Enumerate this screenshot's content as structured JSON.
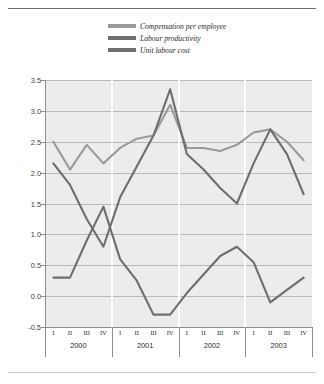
{
  "title": {
    "text": "Chart 3 Changes in unit labour costs, compensation per employee and labour productivity"
  },
  "legend": {
    "position": "top",
    "items": [
      {
        "label": "Compensation per employee",
        "color": "#9a9a9a",
        "key": "compensation_per_employee"
      },
      {
        "label": "Labour productivity",
        "color": "#6e6e6e",
        "key": "labour_productivity"
      },
      {
        "label": "Unit labour cost",
        "color": "#6e6e6e",
        "key": "unit_labour_cost"
      }
    ]
  },
  "axes": {
    "y_ticks": [
      "3.5",
      "3.0",
      "2.5",
      "2.0",
      "1.5",
      "1.0",
      "0.5",
      "0.0",
      "-0.5"
    ],
    "y_min": -0.5,
    "y_max": 3.5,
    "y_step": 0.5,
    "quarters": [
      "I",
      "II",
      "III",
      "IV",
      "I",
      "II",
      "III",
      "IV",
      "I",
      "II",
      "III",
      "IV",
      "I",
      "II",
      "III",
      "IV"
    ],
    "years": [
      "2000",
      "2001",
      "2002",
      "2003"
    ]
  },
  "colors": {
    "plot_background": "#ececec",
    "gridline": "#b9b9b9",
    "axis": "#8e8e8e",
    "series_light": "#9a9a9a",
    "series_dark": "#6e6e6e",
    "text": "#2b2b2b"
  },
  "chart_data": {
    "type": "line",
    "title": "Chart 3 Changes in unit labour costs, compensation per employee and labour productivity",
    "xlabel": "",
    "ylabel": "",
    "ylim": [
      -0.5,
      3.5
    ],
    "grid": true,
    "legend_position": "top",
    "categories": [
      "2000 I",
      "2000 II",
      "2000 III",
      "2000 IV",
      "2001 I",
      "2001 II",
      "2001 III",
      "2001 IV",
      "2002 I",
      "2002 II",
      "2002 III",
      "2002 IV",
      "2003 I",
      "2003 II",
      "2003 III",
      "2003 IV"
    ],
    "series": [
      {
        "name": "Compensation per employee",
        "color": "#9a9a9a",
        "values": [
          2.5,
          2.05,
          2.45,
          2.15,
          2.4,
          2.55,
          2.6,
          3.1,
          2.4,
          2.4,
          2.35,
          2.45,
          2.65,
          2.7,
          2.5,
          2.2
        ]
      },
      {
        "name": "Labour productivity",
        "color": "#6e6e6e",
        "values": [
          0.3,
          0.3,
          0.9,
          1.45,
          0.6,
          0.25,
          -0.3,
          -0.3,
          0.05,
          0.35,
          0.65,
          0.8,
          0.55,
          -0.1,
          0.1,
          0.3
        ]
      },
      {
        "name": "Unit labour cost",
        "color": "#6e6e6e",
        "values": [
          2.15,
          1.8,
          1.25,
          0.8,
          1.6,
          2.1,
          2.6,
          3.35,
          2.3,
          2.05,
          1.75,
          1.5,
          2.15,
          2.7,
          2.3,
          1.65
        ]
      }
    ]
  }
}
